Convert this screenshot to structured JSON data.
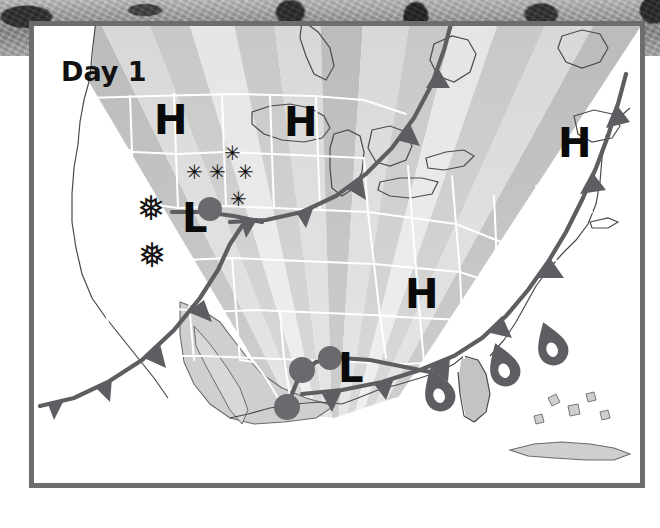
{
  "map": {
    "title": "Day 1",
    "frame_color": "#6d6d70",
    "background_texture": "stone-texture",
    "region": "United States"
  },
  "pressure_centers": [
    {
      "type": "H",
      "name": "high-pressure-northwest",
      "x": 120,
      "y": 74,
      "size": 40
    },
    {
      "type": "H",
      "name": "high-pressure-north-central",
      "x": 250,
      "y": 76,
      "size": 40
    },
    {
      "type": "H",
      "name": "high-pressure-northeast",
      "x": 524,
      "y": 97,
      "size": 40
    },
    {
      "type": "H",
      "name": "high-pressure-southeast",
      "x": 371,
      "y": 248,
      "size": 40
    },
    {
      "type": "L",
      "name": "low-pressure-northern-rockies",
      "x": 148,
      "y": 172,
      "size": 40
    },
    {
      "type": "L",
      "name": "low-pressure-texas",
      "x": 304,
      "y": 322,
      "size": 40
    }
  ],
  "snow_symbols": [
    {
      "glyph": "✳",
      "name": "snow-star-1",
      "x": 190,
      "y": 117,
      "size": 20
    },
    {
      "glyph": "✳",
      "name": "snow-star-2",
      "x": 152,
      "y": 136,
      "size": 20
    },
    {
      "glyph": "✳",
      "name": "snow-star-3",
      "x": 175,
      "y": 136,
      "size": 20
    },
    {
      "glyph": "✳",
      "name": "snow-star-4",
      "x": 203,
      "y": 136,
      "size": 20
    },
    {
      "glyph": "✳",
      "name": "snow-star-5",
      "x": 196,
      "y": 163,
      "size": 20
    }
  ],
  "snowflake_symbols": [
    {
      "glyph": "❅",
      "name": "snowflake-1",
      "x": 103,
      "y": 165,
      "size": 34
    },
    {
      "glyph": "❅",
      "name": "snowflake-2",
      "x": 104,
      "y": 212,
      "size": 34
    }
  ],
  "rain_symbols": [
    {
      "name": "raindrop-gulf",
      "x": 432,
      "y": 382,
      "angle": -22
    },
    {
      "name": "raindrop-florida",
      "x": 497,
      "y": 357,
      "angle": -22
    },
    {
      "name": "raindrop-atlantic",
      "x": 545,
      "y": 336,
      "angle": -22
    }
  ],
  "fronts": [
    {
      "name": "cold-front-pacific-to-plains",
      "type": "cold"
    },
    {
      "name": "cold-front-gulf-coast",
      "type": "cold"
    },
    {
      "name": "cold-front-canada-northeast",
      "type": "cold"
    },
    {
      "name": "cold-front-atlantic",
      "type": "cold"
    },
    {
      "name": "warm-front-northern-plains",
      "type": "warm"
    },
    {
      "name": "warm-front-texas",
      "type": "warm"
    }
  ],
  "legend": {
    "cold_front_color": "#5e5e62",
    "warm_front_color": "#5e5e62",
    "land_color": "#d8d8d8",
    "ocean_color": "#ffffff",
    "state_border_color": "#ffffff"
  },
  "temperature_bands": {
    "description": "fan-shaped grayscale temperature bands radiating across the continent",
    "shades": [
      "#f2f2f2",
      "#e6e6e6",
      "#dadada",
      "#cfcfcf",
      "#c4c4c4",
      "#bcbcbc",
      "#b3b3b3"
    ]
  }
}
